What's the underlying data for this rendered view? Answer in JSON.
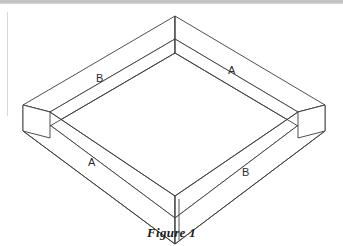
{
  "figure": {
    "caption": "Figure 1",
    "labels": [
      {
        "id": "label-upper-left",
        "text": "B",
        "x": 100,
        "y": 82,
        "side": "upper-left rail"
      },
      {
        "id": "label-upper-right",
        "text": "A",
        "x": 232,
        "y": 74,
        "side": "upper-right rail"
      },
      {
        "id": "label-lower-left",
        "text": "A",
        "x": 92,
        "y": 166,
        "side": "lower-left rail"
      },
      {
        "id": "label-lower-right",
        "text": "B",
        "x": 246,
        "y": 176,
        "side": "lower-right rail"
      }
    ],
    "geometry": {
      "stroke_color": "#3c3c3c",
      "fill_color": "#ffffff",
      "stroke_width": 0.9,
      "corners": {
        "back": {
          "x": 175,
          "y": 16
        },
        "left": {
          "x": 23,
          "y": 105
        },
        "right": {
          "x": 325,
          "y": 105
        },
        "front": {
          "x": 175,
          "y": 218
        }
      },
      "rail_width_px": 11,
      "rail_height_px": 26
    },
    "artifacts": {
      "top_band_color": "#c3c3c3",
      "left_rule_color": "#d7d7d7"
    }
  }
}
